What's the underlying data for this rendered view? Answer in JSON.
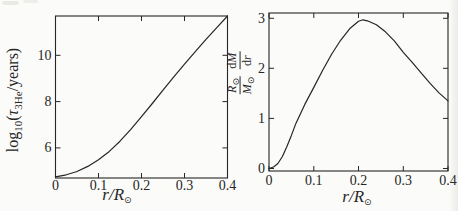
{
  "figure": {
    "background_color": "#fbfbf9",
    "line_color": "#262626",
    "description_note": "Two-panel line figure on scanned-paper background"
  },
  "chart_data": [
    {
      "type": "line",
      "panel": "left",
      "title": "",
      "xlabel": "r/R⊙",
      "ylabel": "log10(τ3He/years)",
      "xlabel_parts": {
        "main": "r/R",
        "sub": "⊙"
      },
      "ylabel_parts": {
        "fn": "log",
        "fnsub": "10",
        "open": "(",
        "tau": "τ",
        "tausub": "3He",
        "close": "/years)"
      },
      "xlim": [
        0,
        0.4
      ],
      "ylim": [
        4.7,
        11.7
      ],
      "xticks": [
        0,
        0.1,
        0.2,
        0.3,
        0.4
      ],
      "xtick_labels": [
        "0",
        "0.1",
        "0.2",
        "0.3",
        "0.4"
      ],
      "yticks": [
        6,
        8,
        10
      ],
      "ytick_labels": [
        "6",
        "8",
        "10"
      ],
      "grid": false,
      "legend": null,
      "x": [
        0,
        0.025,
        0.05,
        0.075,
        0.1,
        0.125,
        0.15,
        0.175,
        0.2,
        0.225,
        0.25,
        0.275,
        0.3,
        0.325,
        0.35,
        0.375,
        0.4
      ],
      "y": [
        4.75,
        4.84,
        4.98,
        5.2,
        5.49,
        5.85,
        6.29,
        6.8,
        7.35,
        7.92,
        8.5,
        9.07,
        9.62,
        10.16,
        10.69,
        11.2,
        11.7
      ]
    },
    {
      "type": "line",
      "panel": "right",
      "title": "",
      "xlabel": "r/R⊙",
      "ylabel": "(R⊙/M⊙)(dM/dr)",
      "xlabel_parts": {
        "main": "r/R",
        "sub": "⊙"
      },
      "ylabel_parts": {
        "f1num": "R",
        "f1numsub": "⊙",
        "f1den": "M",
        "f1densub": "⊙",
        "f2numd": "d",
        "f2numv": "M",
        "f2dend": "d",
        "f2denv": "r"
      },
      "xlim": [
        0,
        0.4
      ],
      "ylim": [
        -0.05,
        3.105
      ],
      "xticks": [
        0,
        0.1,
        0.2,
        0.3,
        0.4
      ],
      "xtick_labels": [
        "0",
        "0.1",
        "0.2",
        "0.3",
        "0.4"
      ],
      "yticks": [
        0,
        1,
        2,
        3
      ],
      "ytick_labels": [
        "0",
        "1",
        "2",
        "3"
      ],
      "grid": false,
      "legend": null,
      "x": [
        0,
        0.01,
        0.02,
        0.03,
        0.04,
        0.05,
        0.06,
        0.08,
        0.1,
        0.12,
        0.14,
        0.16,
        0.18,
        0.2,
        0.21,
        0.22,
        0.24,
        0.26,
        0.28,
        0.3,
        0.32,
        0.34,
        0.36,
        0.38,
        0.4
      ],
      "y": [
        0,
        0.03,
        0.1,
        0.24,
        0.44,
        0.66,
        0.9,
        1.28,
        1.62,
        1.96,
        2.28,
        2.56,
        2.79,
        2.94,
        2.97,
        2.95,
        2.87,
        2.73,
        2.55,
        2.32,
        2.12,
        1.91,
        1.7,
        1.51,
        1.35
      ]
    }
  ]
}
